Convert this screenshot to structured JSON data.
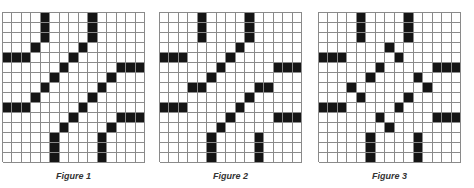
{
  "rows": 15,
  "cols": 15,
  "colors": {
    "filled": "#151515",
    "empty": "#ffffff",
    "gridline": "#8a8a8a"
  },
  "figures": [
    {
      "caption": "Figure 1",
      "filled": [
        [
          0,
          4
        ],
        [
          1,
          4
        ],
        [
          2,
          4
        ],
        [
          0,
          9
        ],
        [
          1,
          9
        ],
        [
          2,
          9
        ],
        [
          3,
          3
        ],
        [
          3,
          8
        ],
        [
          4,
          0
        ],
        [
          4,
          1
        ],
        [
          4,
          2
        ],
        [
          4,
          7
        ],
        [
          5,
          6
        ],
        [
          5,
          12
        ],
        [
          5,
          13
        ],
        [
          5,
          14
        ],
        [
          6,
          5
        ],
        [
          6,
          11
        ],
        [
          7,
          4
        ],
        [
          7,
          10
        ],
        [
          8,
          3
        ],
        [
          8,
          9
        ],
        [
          9,
          0
        ],
        [
          9,
          1
        ],
        [
          9,
          2
        ],
        [
          9,
          8
        ],
        [
          10,
          7
        ],
        [
          10,
          12
        ],
        [
          10,
          13
        ],
        [
          10,
          14
        ],
        [
          11,
          6
        ],
        [
          11,
          11
        ],
        [
          12,
          5
        ],
        [
          13,
          5
        ],
        [
          14,
          5
        ],
        [
          12,
          10
        ],
        [
          13,
          10
        ],
        [
          14,
          10
        ]
      ]
    },
    {
      "caption": "Figure 2",
      "filled": [
        [
          0,
          4
        ],
        [
          1,
          4
        ],
        [
          2,
          4
        ],
        [
          0,
          9
        ],
        [
          1,
          9
        ],
        [
          2,
          9
        ],
        [
          3,
          8
        ],
        [
          4,
          0
        ],
        [
          4,
          1
        ],
        [
          4,
          2
        ],
        [
          4,
          7
        ],
        [
          5,
          6
        ],
        [
          5,
          12
        ],
        [
          5,
          13
        ],
        [
          5,
          14
        ],
        [
          6,
          5
        ],
        [
          7,
          3
        ],
        [
          7,
          4
        ],
        [
          7,
          10
        ],
        [
          7,
          11
        ],
        [
          8,
          9
        ],
        [
          9,
          0
        ],
        [
          9,
          1
        ],
        [
          9,
          2
        ],
        [
          9,
          8
        ],
        [
          10,
          7
        ],
        [
          10,
          12
        ],
        [
          10,
          13
        ],
        [
          10,
          14
        ],
        [
          11,
          6
        ],
        [
          12,
          5
        ],
        [
          13,
          5
        ],
        [
          14,
          5
        ],
        [
          12,
          10
        ],
        [
          13,
          10
        ],
        [
          14,
          10
        ]
      ]
    },
    {
      "caption": "Figure 3",
      "filled": [
        [
          0,
          4
        ],
        [
          1,
          4
        ],
        [
          2,
          4
        ],
        [
          0,
          9
        ],
        [
          1,
          9
        ],
        [
          2,
          9
        ],
        [
          3,
          7
        ],
        [
          4,
          0
        ],
        [
          4,
          1
        ],
        [
          4,
          2
        ],
        [
          4,
          8
        ],
        [
          5,
          6
        ],
        [
          5,
          12
        ],
        [
          5,
          13
        ],
        [
          5,
          14
        ],
        [
          6,
          5
        ],
        [
          6,
          10
        ],
        [
          7,
          3
        ],
        [
          7,
          11
        ],
        [
          8,
          4
        ],
        [
          8,
          9
        ],
        [
          9,
          0
        ],
        [
          9,
          1
        ],
        [
          9,
          2
        ],
        [
          9,
          8
        ],
        [
          10,
          6
        ],
        [
          10,
          12
        ],
        [
          10,
          13
        ],
        [
          10,
          14
        ],
        [
          11,
          7
        ],
        [
          12,
          5
        ],
        [
          13,
          5
        ],
        [
          14,
          5
        ],
        [
          12,
          10
        ],
        [
          13,
          10
        ],
        [
          14,
          10
        ]
      ]
    }
  ]
}
